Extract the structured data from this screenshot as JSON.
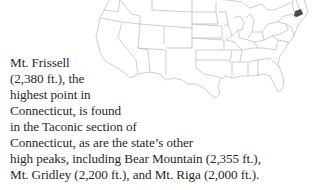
{
  "map": {
    "label": "United States map",
    "highlighted_state": "Connecticut",
    "highlight_color": "#4a4a4a",
    "border_color": "#b5b5b5"
  },
  "caption": {
    "lines": [
      "Mt. Frissell",
      "(2,380 ft.), the",
      "highest point in",
      "Connecticut, is found",
      "in the Taconic section of",
      "Connecticut, as are the state’s other",
      "high peaks, including Bear Mountain (2,355 ft.),",
      "Mt. Gridley (2,200 ft.), and Mt. Riga (2,000 ft.)."
    ]
  }
}
